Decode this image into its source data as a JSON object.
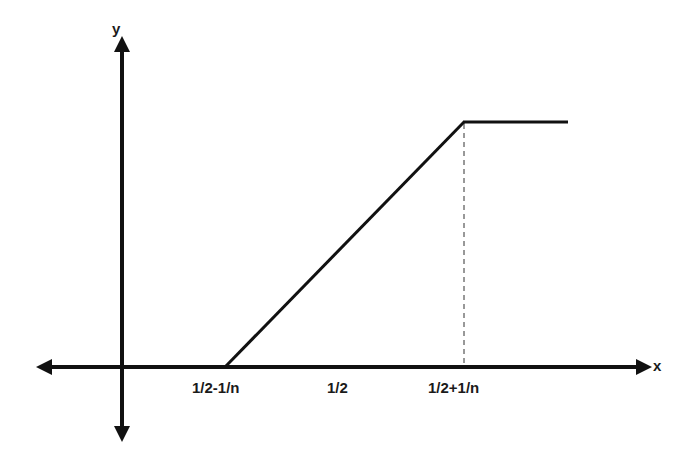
{
  "axes": {
    "x_label": "x",
    "y_label": "y"
  },
  "ticks": [
    {
      "label": "1/2-1/n"
    },
    {
      "label": "1/2"
    },
    {
      "label": "1/2+1/n"
    }
  ],
  "colors": {
    "stroke": "#111111",
    "text": "#1a1a1a",
    "background": "#ffffff"
  },
  "function": {
    "description": "piecewise linear: 0 until 1/2-1/n, rises linearly to 1 at 1/2+1/n, then constant",
    "segments": [
      {
        "from": "1/2-1/n",
        "to": "1/2+1/n",
        "shape": "linear ramp"
      },
      {
        "from": "1/2+1/n",
        "to": "right edge",
        "shape": "constant"
      }
    ],
    "guide": "dashed vertical at 1/2+1/n"
  }
}
